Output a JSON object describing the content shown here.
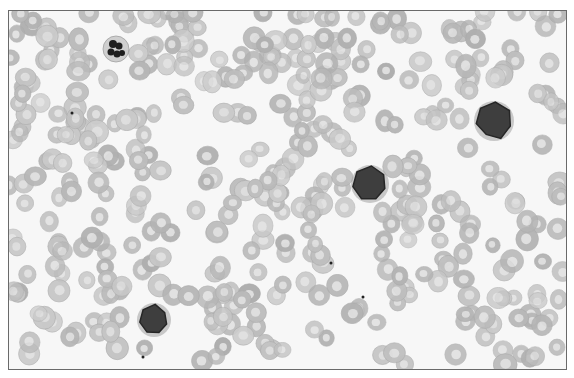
{
  "image": {
    "width": 574,
    "height": 378,
    "background": "#ffffff",
    "frame": {
      "x": 8,
      "y": 10,
      "w": 557,
      "h": 358,
      "border": "#6a6a6a",
      "fill": "#f7f7f7"
    }
  },
  "colors": {
    "rbc_rim": "#bdbdbd",
    "rbc_center": "#dedede",
    "rbc_edge": "#a9a9a9",
    "lymph_fill": "#3e3e3e",
    "lymph_edge": "#262626",
    "lymph_halo": "#9a9a9a",
    "neutrophil_cyto": "#cfcfcf",
    "neutrophil_nucleus": "#1f1f1f"
  },
  "rbc": {
    "count": 430,
    "radius_min": 8,
    "radius_max": 11,
    "seed": 7
  },
  "white_cells": [
    {
      "type": "neutrophil",
      "cx": 115,
      "cy": 48,
      "r": 13
    },
    {
      "type": "lymphocyte",
      "cx": 369,
      "cy": 183,
      "r": 17
    },
    {
      "type": "lymphocyte",
      "cx": 493,
      "cy": 120,
      "r": 18
    },
    {
      "type": "lymphocyte",
      "cx": 153,
      "cy": 319,
      "r": 15
    }
  ],
  "specks": [
    {
      "cx": 330,
      "cy": 262
    },
    {
      "cx": 362,
      "cy": 296
    },
    {
      "cx": 142,
      "cy": 356
    },
    {
      "cx": 71,
      "cy": 112
    }
  ]
}
